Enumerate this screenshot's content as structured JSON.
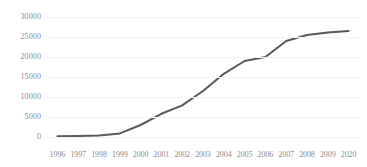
{
  "chart_data": {
    "type": "line",
    "title": "",
    "xlabel": "",
    "ylabel": "",
    "categories": [
      "1996",
      "1997",
      "1998",
      "1999",
      "2000",
      "2001",
      "2002",
      "2003",
      "2004",
      "2005",
      "2006",
      "2007",
      "2008",
      "2009",
      "2020"
    ],
    "values": [
      200,
      250,
      400,
      900,
      3000,
      5800,
      7900,
      11500,
      15800,
      19000,
      20000,
      24000,
      25500,
      26100,
      26500
    ],
    "series": [
      {
        "name": "series-1",
        "values": [
          200,
          250,
          400,
          900,
          3000,
          5800,
          7900,
          11500,
          15800,
          19000,
          20000,
          24000,
          25500,
          26100,
          26500
        ],
        "color": "#595959"
      }
    ],
    "ylim": [
      0,
      30000
    ],
    "yticks": [
      0,
      5000,
      10000,
      15000,
      20000,
      25000,
      30000
    ],
    "ytick_labels": [
      "0",
      "5000",
      "10000",
      "15000",
      "20000",
      "25000",
      "30000"
    ],
    "grid": true,
    "grid_color": "#f2f2f2",
    "legend": false,
    "legend_position": "none",
    "line_color": "#595959",
    "line_width": 2,
    "markers": false,
    "axis_label_color": "#8c8c8c"
  }
}
